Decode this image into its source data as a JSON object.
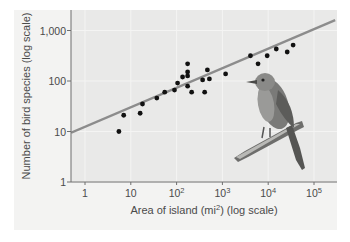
{
  "chart_data": {
    "type": "scatter",
    "title": "",
    "xlabel": "Area of island (mi²) (log scale)",
    "ylabel": "Number of bird species (log scale)",
    "xscale": "log",
    "yscale": "log",
    "xlim": [
      0.5,
      250000
    ],
    "ylim": [
      1,
      1800
    ],
    "x_ticks": [
      1,
      10,
      100,
      1000,
      10000,
      100000
    ],
    "x_tick_labels": [
      "1",
      "10",
      "10²",
      "10³",
      "10⁴",
      "10⁵"
    ],
    "y_ticks": [
      1,
      10,
      100,
      1000
    ],
    "y_tick_labels": [
      "1",
      "10",
      "100",
      "1,000"
    ],
    "grid": true,
    "legend": null,
    "series": [
      {
        "name": "Islands",
        "kind": "scatter",
        "color": "#111111",
        "points": [
          {
            "x": 5.5,
            "y": 10
          },
          {
            "x": 7,
            "y": 21
          },
          {
            "x": 16,
            "y": 23
          },
          {
            "x": 18,
            "y": 35
          },
          {
            "x": 37,
            "y": 46
          },
          {
            "x": 55,
            "y": 60
          },
          {
            "x": 90,
            "y": 66
          },
          {
            "x": 105,
            "y": 91
          },
          {
            "x": 135,
            "y": 120
          },
          {
            "x": 174,
            "y": 219
          },
          {
            "x": 174,
            "y": 151
          },
          {
            "x": 174,
            "y": 126
          },
          {
            "x": 174,
            "y": 79
          },
          {
            "x": 213,
            "y": 60
          },
          {
            "x": 370,
            "y": 105
          },
          {
            "x": 410,
            "y": 60
          },
          {
            "x": 470,
            "y": 166
          },
          {
            "x": 520,
            "y": 110
          },
          {
            "x": 1175,
            "y": 138
          },
          {
            "x": 4100,
            "y": 316
          },
          {
            "x": 6000,
            "y": 219
          },
          {
            "x": 9500,
            "y": 316
          },
          {
            "x": 15000,
            "y": 430
          },
          {
            "x": 26000,
            "y": 375
          },
          {
            "x": 35000,
            "y": 515
          }
        ]
      },
      {
        "name": "Regression line",
        "kind": "line",
        "color": "#8c8c8c",
        "points": [
          {
            "x": 0.5,
            "y": 9.5
          },
          {
            "x": 290000,
            "y": 1600
          }
        ]
      }
    ],
    "annotations": [
      "Illustration of a bird perched on a branch (lower right of plot)"
    ]
  },
  "labels": {
    "xlabel": "Area of island (mi²) (log scale)",
    "ylabel": "Number of bird species (log scale)"
  },
  "colors": {
    "panel_bg": "#f3f3f2",
    "plot_bg": "#e9e9e8",
    "axis": "#6e6e6e",
    "points": "#111111",
    "line": "#8c8c8c"
  }
}
